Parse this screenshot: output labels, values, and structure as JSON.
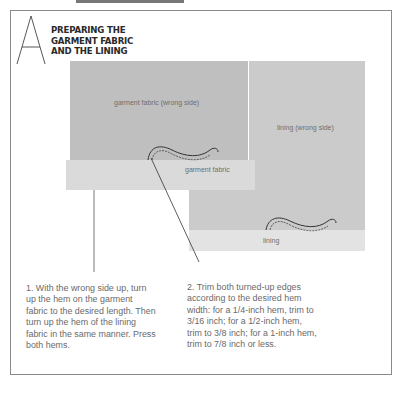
{
  "section": {
    "letter": "A",
    "title_lines": [
      "PREPARING THE",
      "GARMENT FABRIC",
      "AND THE LINING"
    ]
  },
  "illustration": {
    "garment_panel_label": "garment fabric (wrong side)",
    "garment_hem_label": "garment fabric",
    "lining_panel_label": "lining (wrong side)",
    "lining_hem_label": "lining",
    "colors": {
      "garment": "#bfbfbf",
      "garment_hem": "#dadada",
      "lining": "#cbcbcb",
      "lining_hem": "#e3e3e3",
      "frame": "#8a8a8a"
    }
  },
  "steps": [
    {
      "text": "1. With the wrong side up, turn up the hem on the garment fabric to the desired length. Then turn up the hem of the lining fabric in the same manner. Press both hems."
    },
    {
      "text": "2. Trim both turned-up edges according to the desired hem width: for a 1/4-inch hem, trim to 3/16 inch; for a 1/2-inch hem, trim to 3/8 inch; for a 1-inch hem, trim to 7/8 inch or less."
    }
  ]
}
